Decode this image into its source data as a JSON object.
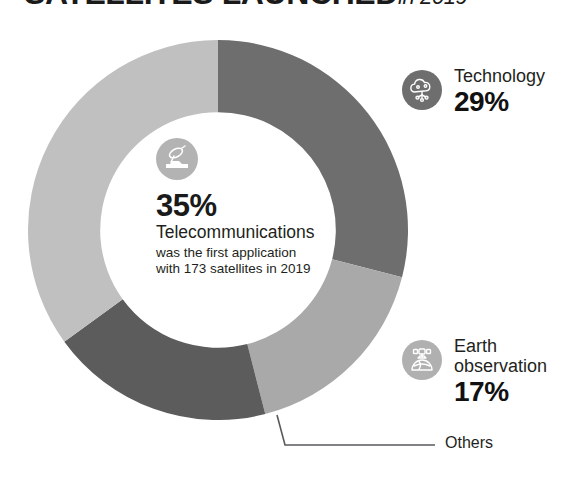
{
  "header": {
    "title": "SATELLITES LAUNCHED",
    "title_suffix": "in 2019",
    "title_clipped": true
  },
  "center": {
    "icon": "satellite-dish-icon",
    "percent": "35%",
    "name": "Telecommunications",
    "note_line1": "was the first application",
    "note_line2": "with 173 satellites in 2019",
    "icon_color": "#b3b3b3"
  },
  "legend": [
    {
      "key": "technology",
      "icon": "tech-cloud-icon",
      "name": "Technology",
      "percent": "29%",
      "badge_color": "#6e6e6e"
    },
    {
      "key": "earth",
      "icon": "earth-observation-icon",
      "name_line1": "Earth",
      "name_line2": "observation",
      "percent": "17%",
      "badge_color": "#b0b0b0"
    }
  ],
  "callout": {
    "label": "Others",
    "leader_color": "#58595b"
  },
  "chart_data": {
    "type": "pie",
    "subtype": "donut",
    "unit": "percent",
    "start_angle_deg": 0,
    "direction": "clockwise",
    "inner_radius_ratio": 0.62,
    "labels": [
      "Technology",
      "Earth observation",
      "Others",
      "Telecommunications"
    ],
    "values": [
      29,
      17,
      19,
      35
    ],
    "colors": [
      "#6e6e6e",
      "#a9a9a9",
      "#5c5c5c",
      "#c0c0c0"
    ],
    "annotations": [
      "35% Telecommunications was the first application with 173 satellites in 2019"
    ],
    "legend": "right",
    "grid": false
  }
}
